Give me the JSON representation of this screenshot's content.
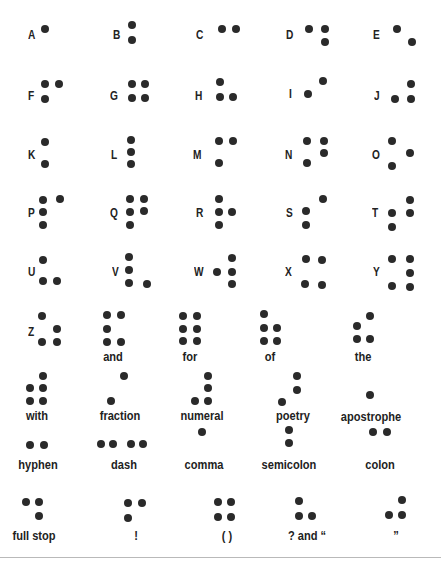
{
  "colors": {
    "dot": "#2a2a2a",
    "text": "#222222",
    "background": "#ffffff",
    "rule": "#b9b9b9"
  },
  "letters": [
    {
      "label": "A",
      "lx": 28,
      "ly": 35,
      "dots": [
        [
          45,
          29
        ]
      ]
    },
    {
      "label": "B",
      "lx": 113,
      "ly": 35,
      "dots": [
        [
          132,
          25
        ],
        [
          132,
          40
        ]
      ]
    },
    {
      "label": "C",
      "lx": 196,
      "ly": 35,
      "dots": [
        [
          222,
          29
        ],
        [
          236,
          29
        ]
      ]
    },
    {
      "label": "D",
      "lx": 286,
      "ly": 35,
      "dots": [
        [
          309,
          29
        ],
        [
          325,
          29
        ],
        [
          325,
          42
        ]
      ]
    },
    {
      "label": "E",
      "lx": 373,
      "ly": 35,
      "dots": [
        [
          397,
          29
        ],
        [
          412,
          42
        ]
      ]
    },
    {
      "label": "F",
      "lx": 28,
      "ly": 96,
      "dots": [
        [
          45,
          84
        ],
        [
          59,
          84
        ],
        [
          45,
          99
        ]
      ]
    },
    {
      "label": "G",
      "lx": 110,
      "ly": 96,
      "dots": [
        [
          132,
          84
        ],
        [
          145,
          84
        ],
        [
          132,
          98
        ],
        [
          145,
          98
        ]
      ]
    },
    {
      "label": "H",
      "lx": 195,
      "ly": 96,
      "dots": [
        [
          220,
          82
        ],
        [
          220,
          97
        ],
        [
          233,
          97
        ]
      ]
    },
    {
      "label": "I",
      "lx": 289,
      "ly": 94,
      "dots": [
        [
          323,
          81
        ],
        [
          308,
          94
        ]
      ]
    },
    {
      "label": "J",
      "lx": 374,
      "ly": 96,
      "dots": [
        [
          411,
          84
        ],
        [
          395,
          99
        ],
        [
          411,
          99
        ]
      ]
    },
    {
      "label": "K",
      "lx": 28,
      "ly": 155,
      "dots": [
        [
          45,
          142
        ],
        [
          45,
          164
        ]
      ]
    },
    {
      "label": "L",
      "lx": 111,
      "ly": 155,
      "dots": [
        [
          131,
          140
        ],
        [
          131,
          152
        ],
        [
          131,
          164
        ]
      ]
    },
    {
      "label": "M",
      "lx": 193,
      "ly": 155,
      "dots": [
        [
          219,
          141
        ],
        [
          233,
          141
        ],
        [
          219,
          163
        ]
      ]
    },
    {
      "label": "N",
      "lx": 285,
      "ly": 155,
      "dots": [
        [
          307,
          141
        ],
        [
          324,
          141
        ],
        [
          324,
          153
        ],
        [
          307,
          163
        ]
      ]
    },
    {
      "label": "O",
      "lx": 372,
      "ly": 155,
      "dots": [
        [
          392,
          141
        ],
        [
          410,
          153
        ],
        [
          392,
          166
        ]
      ]
    },
    {
      "label": "P",
      "lx": 28,
      "ly": 213,
      "dots": [
        [
          43,
          200
        ],
        [
          60,
          199
        ],
        [
          43,
          212
        ],
        [
          43,
          225
        ]
      ]
    },
    {
      "label": "Q",
      "lx": 110,
      "ly": 213,
      "dots": [
        [
          130,
          199
        ],
        [
          144,
          199
        ],
        [
          130,
          212
        ],
        [
          144,
          211
        ],
        [
          130,
          225
        ]
      ]
    },
    {
      "label": "R",
      "lx": 196,
      "ly": 213,
      "dots": [
        [
          219,
          199
        ],
        [
          219,
          212
        ],
        [
          232,
          212
        ],
        [
          219,
          225
        ]
      ]
    },
    {
      "label": "S",
      "lx": 286,
      "ly": 213,
      "dots": [
        [
          323,
          199
        ],
        [
          306,
          211
        ],
        [
          306,
          225
        ]
      ]
    },
    {
      "label": "T",
      "lx": 372,
      "ly": 213,
      "dots": [
        [
          410,
          200
        ],
        [
          392,
          213
        ],
        [
          410,
          213
        ],
        [
          392,
          227
        ]
      ]
    },
    {
      "label": "U",
      "lx": 28,
      "ly": 272,
      "dots": [
        [
          43,
          260
        ],
        [
          43,
          281
        ],
        [
          57,
          281
        ]
      ]
    },
    {
      "label": "V",
      "lx": 112,
      "ly": 272,
      "dots": [
        [
          129,
          257
        ],
        [
          129,
          270
        ],
        [
          129,
          283
        ],
        [
          147,
          284
        ]
      ]
    },
    {
      "label": "W",
      "lx": 194,
      "ly": 272,
      "dots": [
        [
          217,
          272
        ],
        [
          232,
          258
        ],
        [
          232,
          272
        ],
        [
          232,
          284
        ]
      ]
    },
    {
      "label": "X",
      "lx": 285,
      "ly": 272,
      "dots": [
        [
          306,
          259
        ],
        [
          322,
          260
        ],
        [
          305,
          284
        ],
        [
          322,
          285
        ]
      ]
    },
    {
      "label": "Y",
      "lx": 373,
      "ly": 272,
      "dots": [
        [
          392,
          259
        ],
        [
          410,
          259
        ],
        [
          410,
          273
        ],
        [
          392,
          286
        ],
        [
          410,
          287
        ]
      ]
    },
    {
      "label": "Z",
      "lx": 28,
      "ly": 332,
      "dots": [
        [
          42,
          316
        ],
        [
          57,
          329
        ],
        [
          42,
          342
        ],
        [
          57,
          342
        ]
      ]
    }
  ],
  "words": [
    {
      "label": "and",
      "cx": 113,
      "ly": 356,
      "dots": [
        [
          107,
          315
        ],
        [
          121,
          315
        ],
        [
          107,
          329
        ],
        [
          107,
          342
        ],
        [
          121,
          342
        ]
      ]
    },
    {
      "label": "for",
      "cx": 190,
      "ly": 356,
      "dots": [
        [
          183,
          316
        ],
        [
          197,
          316
        ],
        [
          183,
          329
        ],
        [
          197,
          329
        ],
        [
          183,
          341
        ],
        [
          197,
          341
        ]
      ]
    },
    {
      "label": "of",
      "cx": 270,
      "ly": 356,
      "dots": [
        [
          264,
          314
        ],
        [
          264,
          328
        ],
        [
          277,
          328
        ],
        [
          264,
          341
        ],
        [
          277,
          341
        ]
      ]
    },
    {
      "label": "the",
      "cx": 363,
      "ly": 356,
      "dots": [
        [
          370,
          316
        ],
        [
          357,
          326
        ],
        [
          357,
          339
        ],
        [
          370,
          339
        ]
      ]
    },
    {
      "label": "with",
      "cx": 37,
      "ly": 415,
      "dots": [
        [
          43,
          376
        ],
        [
          30,
          388
        ],
        [
          43,
          388
        ],
        [
          30,
          401
        ],
        [
          43,
          401
        ]
      ]
    },
    {
      "label": "fraction",
      "cx": 120,
      "ly": 415,
      "dots": [
        [
          124,
          376
        ],
        [
          111,
          401
        ]
      ]
    },
    {
      "label": "numeral",
      "cx": 202,
      "ly": 415,
      "dots": [
        [
          208,
          376
        ],
        [
          208,
          388
        ],
        [
          195,
          401
        ],
        [
          208,
          401
        ]
      ]
    },
    {
      "label": "poetry",
      "cx": 293,
      "ly": 415,
      "dots": [
        [
          297,
          376
        ],
        [
          297,
          390
        ],
        [
          282,
          402
        ]
      ]
    },
    {
      "label": "apostrophe",
      "cx": 371,
      "ly": 416,
      "dots": [
        [
          370,
          395
        ]
      ]
    },
    {
      "label": "hyphen",
      "cx": 38,
      "ly": 464,
      "dots": [
        [
          30,
          445
        ],
        [
          44,
          445
        ]
      ]
    },
    {
      "label": "dash",
      "cx": 124,
      "ly": 464,
      "dots": [
        [
          101,
          444
        ],
        [
          113,
          444
        ],
        [
          131,
          444
        ],
        [
          143,
          444
        ]
      ]
    },
    {
      "label": "comma",
      "cx": 204,
      "ly": 464,
      "dots": [
        [
          202,
          432
        ]
      ]
    },
    {
      "label": "semicolon",
      "cx": 289,
      "ly": 464,
      "dots": [
        [
          289,
          430
        ],
        [
          289,
          443
        ]
      ]
    },
    {
      "label": "colon",
      "cx": 380,
      "ly": 464,
      "dots": [
        [
          373,
          432
        ],
        [
          387,
          432
        ]
      ]
    },
    {
      "label": "full stop",
      "cx": 34,
      "ly": 535,
      "dots": [
        [
          26,
          502
        ],
        [
          39,
          502
        ],
        [
          39,
          516
        ]
      ]
    },
    {
      "label": "!",
      "cx": 136,
      "ly": 535,
      "dots": [
        [
          128,
          503
        ],
        [
          142,
          503
        ],
        [
          128,
          518
        ]
      ]
    },
    {
      "label": "( )",
      "cx": 227,
      "ly": 535,
      "dots": [
        [
          218,
          502
        ],
        [
          231,
          502
        ],
        [
          218,
          517
        ],
        [
          231,
          517
        ]
      ]
    },
    {
      "label": "? and “",
      "cx": 307,
      "ly": 535,
      "dots": [
        [
          299,
          501
        ],
        [
          299,
          516
        ],
        [
          312,
          516
        ]
      ]
    },
    {
      "label": "”",
      "cx": 396,
      "ly": 535,
      "dots": [
        [
          402,
          500
        ],
        [
          389,
          515
        ],
        [
          402,
          515
        ]
      ]
    }
  ]
}
